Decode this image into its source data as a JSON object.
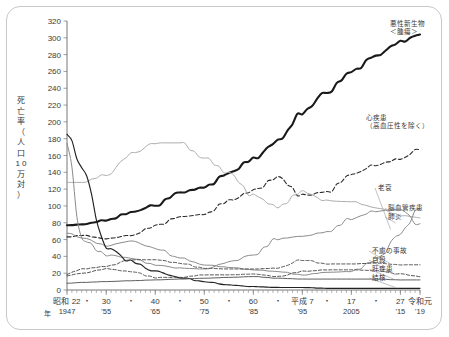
{
  "axis": {
    "y_title_chars": [
      "死",
      "亡",
      "率",
      "（",
      "人",
      "口",
      "1 0",
      "万",
      "対",
      "）"
    ],
    "y_ticks": [
      0,
      20,
      40,
      60,
      80,
      100,
      120,
      140,
      160,
      180,
      200,
      220,
      240,
      260,
      280,
      300,
      320
    ],
    "x_era_labels": [
      "昭和 22",
      "30",
      "40",
      "50",
      "60",
      "平成 7",
      "17",
      "27",
      "令和元"
    ],
    "x_west_labels": [
      "1947",
      "'55",
      "'65",
      "'75",
      "'85",
      "'95",
      "2005",
      "'15",
      "'19"
    ],
    "x_year_unit": "年",
    "x_dot_marks": [
      "・",
      "・",
      "・",
      "・",
      "・",
      "・",
      "・"
    ]
  },
  "labels": {
    "malignant_1": "悪性新生物",
    "malignant_2": "＜腫瘍＞",
    "heart_1": "心疾患",
    "heart_2": "（高血圧性を除く）",
    "senility": "老衰",
    "cerebro": "脳血管疾患",
    "pneumonia": "肺炎",
    "accident": "不慮の事故",
    "suicide": "自殺",
    "liver": "肝疾患",
    "tuberculosis": "結核"
  },
  "colors": {
    "dark": "#1a1a1a",
    "mid": "#8a8a8a",
    "light": "#a8a8a8",
    "border": "#c8c8c8",
    "text": "#3a3a3a"
  },
  "chart_data": {
    "type": "line",
    "title": "",
    "xlabel": "年",
    "ylabel": "死亡率（人口10万対）",
    "xlim": [
      1947,
      2019
    ],
    "ylim": [
      0,
      320
    ],
    "grid": false,
    "legend": "right-inline-labels",
    "x": [
      1947,
      1950,
      1955,
      1960,
      1965,
      1970,
      1975,
      1980,
      1985,
      1990,
      1995,
      2000,
      2005,
      2010,
      2015,
      2019
    ],
    "series": [
      {
        "name": "悪性新生物＜腫瘍＞",
        "style": "solid-thick-dark",
        "values": [
          77,
          78,
          83,
          92,
          101,
          116,
          122,
          139,
          156,
          177,
          211,
          236,
          259,
          279,
          295,
          304
        ]
      },
      {
        "name": "心疾患（高血圧性を除く）",
        "style": "dashed-dark",
        "values": [
          63,
          65,
          61,
          65,
          76,
          87,
          90,
          106,
          118,
          134,
          112,
          117,
          137,
          149,
          156,
          168
        ]
      },
      {
        "name": "脳血管疾患",
        "style": "solid-light",
        "values": [
          128,
          128,
          137,
          161,
          175,
          175,
          157,
          139,
          112,
          99,
          117,
          106,
          105,
          98,
          89,
          86
        ]
      },
      {
        "name": "老衰",
        "style": "solid-mid",
        "values": [
          68,
          62,
          53,
          58,
          50,
          38,
          30,
          27,
          24,
          22,
          18,
          21,
          22,
          35,
          67,
          98
        ]
      },
      {
        "name": "肺炎",
        "style": "solid-mid-lower",
        "values": [
          175,
          60,
          42,
          38,
          30,
          26,
          25,
          33,
          42,
          61,
          64,
          69,
          85,
          94,
          96,
          77
        ]
      },
      {
        "name": "結核",
        "style": "solid-dark-declining",
        "values": [
          187,
          146,
          52,
          34,
          22,
          15,
          10,
          6,
          4,
          3,
          3,
          2,
          2,
          2,
          2,
          2
        ]
      },
      {
        "name": "不慮の事故",
        "style": "dashed-mid",
        "values": [
          19,
          25,
          28,
          36,
          36,
          32,
          26,
          25,
          25,
          26,
          36,
          31,
          31,
          32,
          30,
          30
        ]
      },
      {
        "name": "自殺",
        "style": "dashed-lower",
        "values": [
          17,
          20,
          25,
          22,
          15,
          15,
          18,
          18,
          19,
          16,
          22,
          24,
          24,
          23,
          19,
          16
        ]
      },
      {
        "name": "肝疾患",
        "style": "solid-flat",
        "values": [
          8,
          9,
          10,
          11,
          12,
          13,
          14,
          15,
          16,
          14,
          13,
          13,
          13,
          13,
          12,
          12
        ]
      }
    ]
  }
}
